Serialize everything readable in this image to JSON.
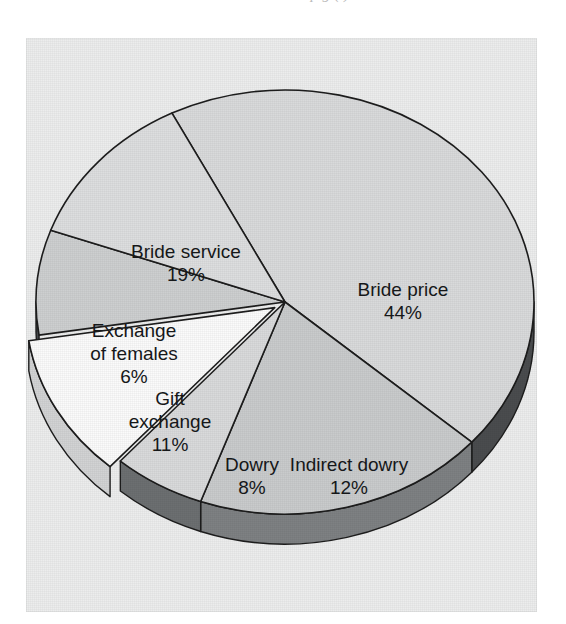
{
  "page": {
    "clipped_text_above": "tation. ... is ... p   g      (     )      "
  },
  "figure": {
    "name": "pie-chart-marriage-transactions",
    "background_color": "#eceded"
  },
  "chart_data": {
    "type": "pie",
    "title": "",
    "subtitle": "",
    "xlabel": "",
    "ylabel": "",
    "legend_position": "none",
    "grid": false,
    "style": "3d-exploded",
    "units": "percent",
    "total": 100,
    "categories": [
      "Bride price",
      "Bride service",
      "Exchange of females",
      "Gift exchange",
      "Dowry",
      "Indirect dowry"
    ],
    "values": [
      44,
      19,
      6,
      11,
      8,
      12
    ],
    "value_labels": [
      "44%",
      "19%",
      "6%",
      "11%",
      "8%",
      "12%"
    ],
    "slices": [
      {
        "label": "Bride price",
        "value": 44,
        "value_label": "44%",
        "top_color": "#d9dadb",
        "wall_color": "#4a4c4e",
        "label_x": 377,
        "label_y": 258,
        "value_x": 377,
        "value_y": 281,
        "exploded": false
      },
      {
        "label": "Bride service",
        "value": 19,
        "value_label": "19%",
        "top_color": "#c9cbcc",
        "wall_color": "#7e8183",
        "label_x": 160,
        "label_y": 220,
        "value_x": 160,
        "value_y": 243,
        "exploded": false
      },
      {
        "label": "Exchange of females",
        "value": 6,
        "value_label": "6%",
        "top_color": "#d9dadb",
        "wall_color": "#6c6f71",
        "label_x": 108,
        "label_y": 299,
        "label_line2": "of females",
        "value_x": 108,
        "value_y": 345,
        "exploded": false
      },
      {
        "label": "Gift exchange",
        "value": 11,
        "value_label": "11%",
        "top_color": "#fbfbfb",
        "wall_color": "#d2d3d4",
        "label_x": 144,
        "label_y": 367,
        "label_line2": "exchange",
        "value_x": 144,
        "value_y": 413,
        "exploded": true
      },
      {
        "label": "Dowry",
        "value": 8,
        "value_label": "8%",
        "top_color": "#cdcfd0",
        "wall_color": "#474a4c",
        "label_x": 226,
        "label_y": 433,
        "value_x": 226,
        "value_y": 456,
        "exploded": false
      },
      {
        "label": "Indirect dowry",
        "value": 12,
        "value_label": "12%",
        "top_color": "#dddedf",
        "wall_color": "#6b6e70",
        "label_x": 323,
        "label_y": 433,
        "value_x": 323,
        "value_y": 456,
        "exploded": false
      }
    ]
  }
}
